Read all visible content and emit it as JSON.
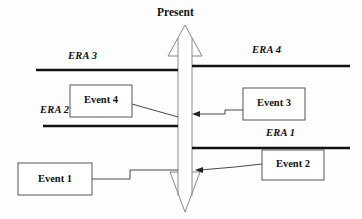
{
  "diagram": {
    "title_label": "Present",
    "axis": {
      "name": "vertical-time-arrow",
      "direction_top": "present",
      "direction_bottom": "past"
    },
    "eras": [
      {
        "id": "era3",
        "label": "ERA 3",
        "side": "left",
        "label_x": 68,
        "label_y": 50,
        "line_y": 70,
        "line_x1": 36,
        "line_x2": 178
      },
      {
        "id": "era4",
        "label": "ERA 4",
        "side": "right",
        "label_x": 252,
        "label_y": 44,
        "line_y": 66,
        "line_x1": 192,
        "line_x2": 350
      },
      {
        "id": "era2",
        "label": "ERA 2",
        "side": "left",
        "label_x": 40,
        "label_y": 104,
        "line_y": 126,
        "line_x1": 43,
        "line_x2": 178
      },
      {
        "id": "era1",
        "label": "ERA 1",
        "side": "right",
        "label_x": 266,
        "label_y": 127,
        "line_y": 148,
        "line_x1": 192,
        "line_x2": 350
      }
    ],
    "events": [
      {
        "id": "event1",
        "label": "Event 1",
        "box_x": 18,
        "box_y": 163,
        "box_w": 74,
        "box_h": 32
      },
      {
        "id": "event2",
        "label": "Event 2",
        "box_x": 262,
        "box_y": 150,
        "box_w": 62,
        "box_h": 30
      },
      {
        "id": "event3",
        "label": "Event 3",
        "box_x": 243,
        "box_y": 88,
        "box_w": 62,
        "box_h": 32
      },
      {
        "id": "event4",
        "label": "Event 4",
        "box_x": 70,
        "box_y": 85,
        "box_w": 62,
        "box_h": 32
      }
    ],
    "colors": {
      "era_line": "#111111",
      "box_border": "#555555",
      "connector": "#333333",
      "arrow_outline": "#777777",
      "text": "#111111",
      "background": "#fdfdfd"
    }
  }
}
